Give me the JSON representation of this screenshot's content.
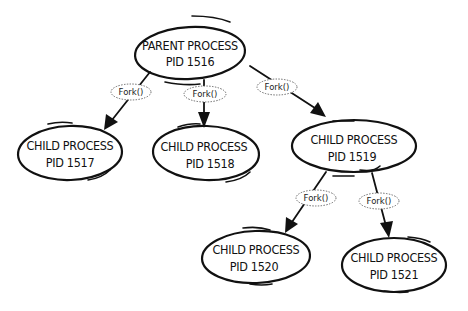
{
  "diagram": {
    "type": "process-tree",
    "colors": {
      "stroke": "#111111",
      "background": "#ffffff",
      "fork_border": "#666666"
    },
    "nodes": [
      {
        "id": "p1516",
        "line1": "PARENT PROCESS",
        "line2": "PID 1516"
      },
      {
        "id": "c1517",
        "line1": "CHILD PROCESS",
        "line2": "PID 1517"
      },
      {
        "id": "c1518",
        "line1": "CHILD PROCESS",
        "line2": "PID 1518"
      },
      {
        "id": "c1519",
        "line1": "CHILD PROCESS",
        "line2": "PID 1519"
      },
      {
        "id": "c1520",
        "line1": "CHILD PROCESS",
        "line2": "PID 1520"
      },
      {
        "id": "c1521",
        "line1": "CHILD PROCESS",
        "line2": "PID 1521"
      }
    ],
    "edges": [
      {
        "from": "p1516",
        "to": "c1517",
        "label": "Fork()"
      },
      {
        "from": "p1516",
        "to": "c1518",
        "label": "Fork()"
      },
      {
        "from": "p1516",
        "to": "c1519",
        "label": "Fork()"
      },
      {
        "from": "c1519",
        "to": "c1520",
        "label": "Fork()"
      },
      {
        "from": "c1519",
        "to": "c1521",
        "label": "Fork()"
      }
    ]
  }
}
